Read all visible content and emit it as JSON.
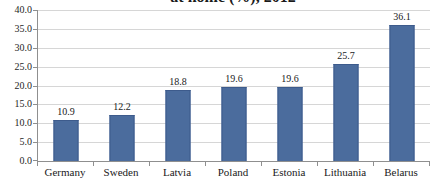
{
  "chart_data": {
    "type": "bar",
    "title": "at home (%), 2012",
    "title_note": "top of title cropped out of view in screenshot",
    "categories": [
      "Germany",
      "Sweden",
      "Latvia",
      "Poland",
      "Estonia",
      "Lithuania",
      "Belarus"
    ],
    "values": [
      10.9,
      12.2,
      18.8,
      19.6,
      19.6,
      25.7,
      36.1
    ],
    "value_labels": [
      "10.9",
      "12.2",
      "18.8",
      "19.6",
      "19.6",
      "25.7",
      "36.1"
    ],
    "ylim": [
      0,
      40
    ],
    "ytick_step": 5,
    "ytick_labels": [
      "0.0",
      "5.0",
      "10.0",
      "15.0",
      "20.0",
      "25.0",
      "30.0",
      "35.0",
      "40.0"
    ],
    "grid": true,
    "legend": false,
    "colors": {
      "bar_fill": "#4b6c9d",
      "bar_border": "#3d5b8c",
      "gridline": "#d6d6d6",
      "axis": "#8f8f8f",
      "text": "#262626"
    }
  }
}
